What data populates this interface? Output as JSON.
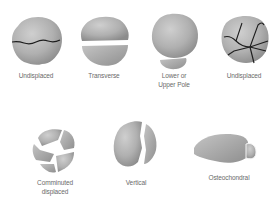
{
  "diagram": {
    "colors": {
      "bone_light": "#c6c6c6",
      "bone_mid": "#a8a8a8",
      "bone_dark": "#8a8a8a",
      "fracture_line": "#1e1e1e",
      "label_text": "#6a6a6a",
      "background": "#ffffff"
    },
    "rows": [
      {
        "items": [
          {
            "id": "undisplaced-1",
            "label": "Undisplaced"
          },
          {
            "id": "transverse",
            "label": "Transverse"
          },
          {
            "id": "lower-upper-pole",
            "label_line1": "Lower or",
            "label_line2": "Upper Pole"
          },
          {
            "id": "undisplaced-2",
            "label": "Undisplaced"
          }
        ]
      },
      {
        "items": [
          {
            "id": "comminuted-displaced",
            "label_line1": "Comminuted",
            "label_line2": "displaced"
          },
          {
            "id": "vertical",
            "label": "Vertical"
          },
          {
            "id": "osteochondral",
            "label": "Osteochondral"
          }
        ]
      }
    ]
  }
}
